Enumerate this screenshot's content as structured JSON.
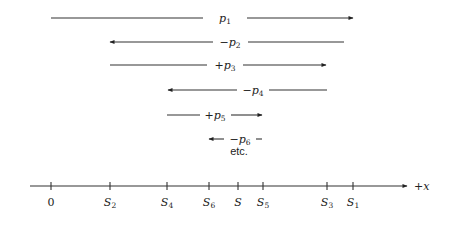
{
  "diagram": {
    "arrows": [
      {
        "label_sign": "",
        "label_var": "p",
        "label_sub": "1",
        "direction": "right",
        "y": 18,
        "x1": 51,
        "gap1": 203,
        "gap2": 247,
        "x2": 353
      },
      {
        "label_sign": "−",
        "label_var": "p",
        "label_sub": "2",
        "direction": "left",
        "y": 42,
        "x1": 110,
        "gap1": 213,
        "gap2": 248,
        "x2": 344
      },
      {
        "label_sign": "+",
        "label_var": "p",
        "label_sub": "3",
        "direction": "right",
        "y": 65,
        "x1": 110,
        "gap1": 207,
        "gap2": 243,
        "x2": 326
      },
      {
        "label_sign": "−",
        "label_var": "p",
        "label_sub": "4",
        "direction": "left",
        "y": 90,
        "x1": 168,
        "gap1": 237,
        "gap2": 269,
        "x2": 327
      },
      {
        "label_sign": "+",
        "label_var": "p",
        "label_sub": "5",
        "direction": "right",
        "y": 115,
        "x1": 167,
        "gap1": 200,
        "gap2": 231,
        "x2": 262
      },
      {
        "label_sign": "−",
        "label_var": "p",
        "label_sub": "6",
        "direction": "left",
        "y": 139,
        "x1": 209,
        "gap1": 224,
        "gap2": 256,
        "x2": 262
      }
    ],
    "continuation_text": "etc.",
    "axis": {
      "label": "+x",
      "ticks": [
        {
          "name": "0",
          "sub": "",
          "x": 51
        },
        {
          "name": "S",
          "sub": "2",
          "x": 110
        },
        {
          "name": "S",
          "sub": "4",
          "x": 167
        },
        {
          "name": "S",
          "sub": "6",
          "x": 209
        },
        {
          "name": "S",
          "sub": "",
          "x": 238
        },
        {
          "name": "S",
          "sub": "5",
          "x": 263
        },
        {
          "name": "S",
          "sub": "3",
          "x": 327
        },
        {
          "name": "S",
          "sub": "1",
          "x": 353
        }
      ]
    }
  }
}
